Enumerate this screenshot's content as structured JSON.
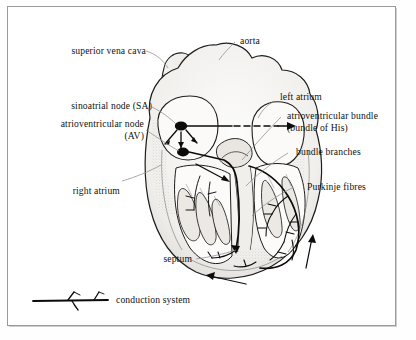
{
  "figure": {
    "type": "labelled anatomical diagram",
    "border_color": "#9a9a9a",
    "background_color": "#ffffff",
    "ink_color": "#111111",
    "leader_line_color": "#8d8d8d",
    "tissue_fill": "#f2f1ef",
    "tissue_shadow": "#d8d6d2"
  },
  "labels": {
    "superior_vena_cava": "superior vena cava",
    "aorta": "aorta",
    "sinoatrial_node": "sinoatrial  node (SA)",
    "atrioventricular_node_line1": "atrioventricular node",
    "atrioventricular_node_line2": "(AV)",
    "left_atrium": "left atrium",
    "av_bundle_line1": "atrioventricular bundle",
    "av_bundle_line2": "(bundle of His)",
    "bundle_branches": "bundle branches",
    "purkinje_fibres": "Purkinje fibres",
    "right_atrium": "right atrium",
    "septum": "septum"
  },
  "legend": {
    "key_label": "conduction system",
    "symbol": "branching-line-icon"
  },
  "annotations": {
    "sa_node_marker": "sinoatrial node (filled ellipse)",
    "av_node_marker": "atrioventricular node (filled ellipse)",
    "impulse_arrows": "arrows showing direction of impulse spread",
    "dashed_arrow": "dashed arrow across atria to left atrium"
  }
}
